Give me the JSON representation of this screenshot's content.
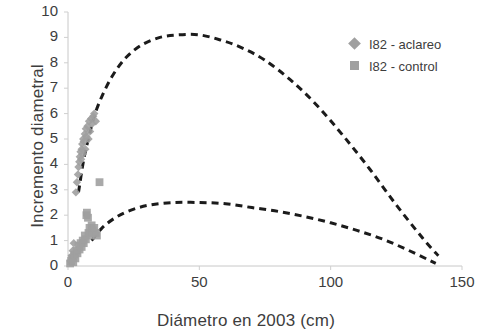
{
  "chart_data": {
    "type": "scatter",
    "title": "",
    "xlabel": "Diámetro en 2003 (cm)",
    "ylabel": "Incremento diametral",
    "xlim": [
      0,
      150
    ],
    "ylim": [
      0,
      10
    ],
    "xticks": [
      0,
      50,
      100,
      150
    ],
    "yticks": [
      0,
      1,
      2,
      3,
      4,
      5,
      6,
      7,
      8,
      9,
      10
    ],
    "grid": false,
    "legend_position": "upper-right",
    "marker_color": "#a0a0a0",
    "curve_color": "#1b1b1b",
    "series": [
      {
        "name": "I82 - aclareo",
        "marker": "diamond",
        "color": "#a0a0a0",
        "points": [
          [
            1.0,
            0.2
          ],
          [
            1.4,
            0.4
          ],
          [
            1.8,
            0.6
          ],
          [
            2.2,
            0.9
          ],
          [
            3.0,
            2.9
          ],
          [
            3.4,
            3.3
          ],
          [
            3.8,
            3.6
          ],
          [
            4.0,
            3.9
          ],
          [
            4.3,
            4.1
          ],
          [
            4.5,
            4.3
          ],
          [
            4.8,
            4.5
          ],
          [
            5.0,
            4.2
          ],
          [
            5.2,
            4.6
          ],
          [
            5.4,
            4.8
          ],
          [
            5.6,
            4.4
          ],
          [
            5.8,
            5.0
          ],
          [
            6.0,
            4.9
          ],
          [
            6.4,
            5.2
          ],
          [
            6.6,
            4.6
          ],
          [
            6.8,
            5.4
          ],
          [
            7.0,
            5.1
          ],
          [
            7.4,
            5.5
          ],
          [
            7.8,
            5.0
          ],
          [
            8.0,
            5.7
          ],
          [
            8.4,
            5.3
          ],
          [
            8.8,
            5.8
          ],
          [
            9.2,
            5.6
          ],
          [
            9.6,
            5.9
          ],
          [
            10.0,
            6.0
          ],
          [
            10.6,
            5.7
          ]
        ]
      },
      {
        "name": "I82 - control",
        "marker": "square",
        "color": "#a0a0a0",
        "points": [
          [
            0.8,
            0.1
          ],
          [
            1.2,
            0.2
          ],
          [
            1.6,
            0.3
          ],
          [
            2.0,
            0.15
          ],
          [
            2.4,
            0.45
          ],
          [
            2.8,
            0.3
          ],
          [
            3.2,
            0.6
          ],
          [
            3.6,
            0.5
          ],
          [
            4.0,
            0.8
          ],
          [
            4.4,
            0.65
          ],
          [
            4.8,
            0.9
          ],
          [
            5.2,
            0.75
          ],
          [
            5.6,
            1.0
          ],
          [
            6.0,
            0.9
          ],
          [
            6.4,
            1.2
          ],
          [
            6.8,
            1.05
          ],
          [
            7.0,
            2.0
          ],
          [
            7.2,
            2.1
          ],
          [
            7.6,
            1.9
          ],
          [
            7.8,
            1.3
          ],
          [
            8.2,
            1.5
          ],
          [
            8.6,
            1.2
          ],
          [
            9.0,
            1.6
          ],
          [
            9.4,
            1.4
          ],
          [
            10.0,
            1.5
          ],
          [
            10.6,
            1.3
          ],
          [
            11.0,
            1.2
          ],
          [
            12.0,
            3.3
          ]
        ]
      }
    ],
    "curves": [
      {
        "name": "aclareo fit",
        "style": "dashed",
        "color": "#1b1b1b",
        "points": [
          [
            4,
            2.9
          ],
          [
            6,
            4.2
          ],
          [
            8,
            5.1
          ],
          [
            10,
            5.9
          ],
          [
            13,
            6.7
          ],
          [
            17,
            7.5
          ],
          [
            22,
            8.2
          ],
          [
            28,
            8.7
          ],
          [
            35,
            9.0
          ],
          [
            42,
            9.1
          ],
          [
            50,
            9.1
          ],
          [
            58,
            8.9
          ],
          [
            66,
            8.6
          ],
          [
            75,
            8.1
          ],
          [
            85,
            7.3
          ],
          [
            95,
            6.3
          ],
          [
            105,
            5.1
          ],
          [
            115,
            3.8
          ],
          [
            125,
            2.4
          ],
          [
            135,
            1.1
          ],
          [
            141,
            0.4
          ]
        ]
      },
      {
        "name": "control fit",
        "style": "dashed",
        "color": "#1b1b1b",
        "points": [
          [
            9,
            1.0
          ],
          [
            13,
            1.5
          ],
          [
            18,
            1.9
          ],
          [
            24,
            2.2
          ],
          [
            31,
            2.4
          ],
          [
            40,
            2.5
          ],
          [
            50,
            2.5
          ],
          [
            60,
            2.45
          ],
          [
            70,
            2.3
          ],
          [
            80,
            2.15
          ],
          [
            90,
            1.95
          ],
          [
            100,
            1.7
          ],
          [
            110,
            1.4
          ],
          [
            120,
            1.05
          ],
          [
            130,
            0.6
          ],
          [
            140,
            0.1
          ]
        ]
      }
    ]
  },
  "legend": {
    "items": [
      {
        "label": "I82 - aclareo",
        "marker": "diamond"
      },
      {
        "label": "I82 - control",
        "marker": "square"
      }
    ]
  },
  "axes": {
    "x_title": "Diámetro en 2003 (cm)",
    "y_title": "Incremento diametral",
    "x_tick_labels": [
      "0",
      "50",
      "100",
      "150"
    ],
    "y_tick_labels": [
      "0",
      "1",
      "2",
      "3",
      "4",
      "5",
      "6",
      "7",
      "8",
      "9",
      "10"
    ]
  }
}
